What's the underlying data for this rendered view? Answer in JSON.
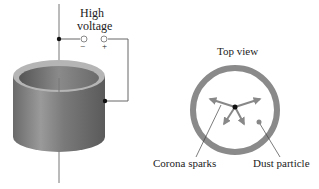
{
  "diagram": {
    "high_voltage_label_line1": "High",
    "high_voltage_label_line2": "voltage",
    "minus_sign": "−",
    "plus_sign": "+",
    "top_view_label": "Top view",
    "corona_label": "Corona sparks",
    "dust_label": "Dust particle"
  }
}
